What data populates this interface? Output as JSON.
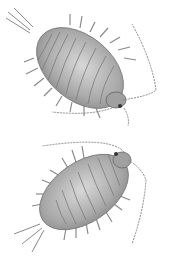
{
  "image": {
    "subject": "scientific illustration of two isopods (woodlice)",
    "background_color": "#ffffff",
    "ink_color": "#6a6a6a",
    "body_fill": "#bdbdbd",
    "specimens": [
      {
        "name": "upper-isopod",
        "orientation": "head toward lower-right, tail toward upper-left"
      },
      {
        "name": "lower-isopod",
        "orientation": "head toward upper-right, tail toward lower-left"
      }
    ]
  }
}
